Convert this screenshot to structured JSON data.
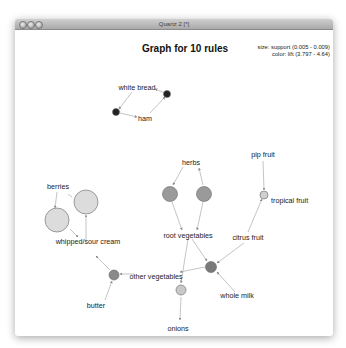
{
  "window": {
    "title": "Quartz 2 [*]",
    "buttons": [
      "close",
      "minimize",
      "zoom"
    ]
  },
  "graph": {
    "title": "Graph for 10 rules",
    "legend": {
      "size": "size: support (0.005 - 0.009)",
      "color": "color: lift (3.797 - 4.64)"
    },
    "items": [
      {
        "id": "white_bread",
        "label": "white bread"
      },
      {
        "id": "ham",
        "label": "ham"
      },
      {
        "id": "herbs",
        "label": "herbs"
      },
      {
        "id": "pip_fruit",
        "label": "pip fruit"
      },
      {
        "id": "tropical_fruit",
        "label": "tropical fruit"
      },
      {
        "id": "berries",
        "label": "berries"
      },
      {
        "id": "whipped_sour_cream",
        "label": "whipped/sour cream"
      },
      {
        "id": "root_vegetables",
        "label": "root vegetables"
      },
      {
        "id": "citrus_fruit",
        "label": "citrus fruit"
      },
      {
        "id": "other_vegetables",
        "label": "other vegetables"
      },
      {
        "id": "whole_milk",
        "label": "whole milk"
      },
      {
        "id": "butter",
        "label": "butter"
      },
      {
        "id": "onions",
        "label": "onions"
      }
    ],
    "rules": [
      {
        "id": "r1",
        "lhs": [
          "ham"
        ],
        "rhs": "white bread",
        "fill": "#222222",
        "r": 3.5
      },
      {
        "id": "r2",
        "lhs": [
          "white bread"
        ],
        "rhs": "ham",
        "fill": "#222222",
        "r": 3.5
      },
      {
        "id": "r3",
        "lhs": [
          "root vegetables"
        ],
        "rhs": "herbs",
        "fill": "#9a9a9a",
        "r": 7
      },
      {
        "id": "r4",
        "lhs": [
          "herbs"
        ],
        "rhs": "root vegetables",
        "fill": "#9a9a9a",
        "r": 7
      },
      {
        "id": "r5",
        "lhs": [
          "pip fruit",
          "citrus fruit"
        ],
        "rhs": "tropical fruit",
        "fill": "#d0d0d0",
        "r": 3.5
      },
      {
        "id": "r6",
        "lhs": [
          "berries"
        ],
        "rhs": "whipped/sour cream",
        "fill": "#d8d8d8",
        "r": 12
      },
      {
        "id": "r7",
        "lhs": [
          "whipped/sour cream"
        ],
        "rhs": "berries",
        "fill": "#d8d8d8",
        "r": 12
      },
      {
        "id": "r8",
        "lhs": [
          "butter",
          "other vegetables"
        ],
        "rhs": "whipped/sour cream",
        "fill": "#8a8a8a",
        "r": 5
      },
      {
        "id": "r9",
        "lhs": [
          "root vegetables",
          "onions"
        ],
        "rhs": "other vegetables",
        "fill": "#c8c8c8",
        "r": 5
      },
      {
        "id": "r10",
        "lhs": [
          "citrus fruit",
          "root vegetables",
          "whole milk"
        ],
        "rhs": "other vegetables",
        "fill": "#7a7a7a",
        "r": 6
      }
    ]
  }
}
